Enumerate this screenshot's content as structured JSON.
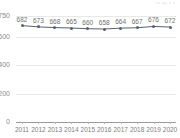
{
  "watermark": "xz.yy  z  z.",
  "chart_data": {
    "type": "line",
    "title": "",
    "subtitle": "",
    "xlabel": "",
    "ylabel": "",
    "categories": [
      "2011",
      "2012",
      "2013",
      "2014",
      "2015",
      "2016",
      "2017",
      "2018",
      "2019",
      "2020"
    ],
    "values": [
      682,
      673,
      668,
      665,
      660,
      658,
      664,
      667,
      676,
      672
    ],
    "data_labels": [
      "682",
      "673",
      "668",
      "665",
      "660",
      "658",
      "664",
      "667",
      "676",
      "672"
    ],
    "series": [
      {
        "name": "",
        "values": [
          682,
          673,
          668,
          665,
          660,
          658,
          664,
          667,
          676,
          672
        ]
      }
    ],
    "ylim": [
      0,
      750
    ],
    "ytick_labels": [
      "750",
      "600",
      "400",
      "200",
      "0"
    ],
    "ytick_values": [
      750,
      600,
      400,
      200,
      0
    ],
    "grid": true,
    "legend": false,
    "legend_position": "none",
    "line_color": "#5a6070",
    "marker_color": "#5a6070",
    "grid_color": "#e8e8e8",
    "axis_color": "#9a9a9a",
    "label_color": "#6f6f6f"
  }
}
